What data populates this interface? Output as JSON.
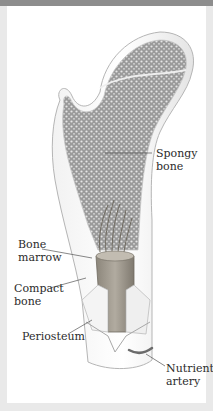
{
  "figure": {
    "labels": {
      "spongy_bone": "Spongy\nbone",
      "bone_marrow": "Bone\nmarrow",
      "compact_bone": "Compact\nbone",
      "periosteum": "Periosteum",
      "nutrient_artery": "Nutrient\nartery"
    }
  },
  "colors": {
    "frame": "#e9e9e9",
    "top_bar": "#8d8d8d",
    "background": "#ffffff",
    "bone_outline": "#b5b5b5",
    "spongy_texture": "#7a7a7a",
    "marrow": "#8a8478",
    "label_text": "#2b2b2b"
  }
}
